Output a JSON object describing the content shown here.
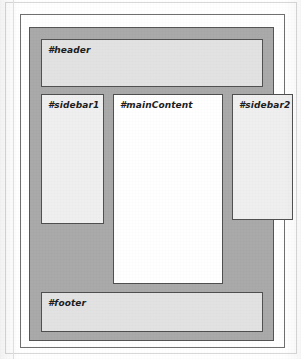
{
  "figure": {
    "type": "css-layout-diagram",
    "container": {
      "label": "#container"
    },
    "regions": [
      {
        "id": "header",
        "label": "#header"
      },
      {
        "id": "sidebar1",
        "label": "#sidebar1"
      },
      {
        "id": "mainContent",
        "label": "#mainContent"
      },
      {
        "id": "sidebar2",
        "label": "#sidebar2"
      },
      {
        "id": "footer",
        "label": "#footer"
      }
    ],
    "colors": {
      "container_fill": "#a9a9a9",
      "band_fill": "#e2e2e2",
      "sidebar_fill": "#efefef",
      "main_fill": "#ffffff",
      "border": "#4f4f4f",
      "page": "#ffffff"
    }
  }
}
